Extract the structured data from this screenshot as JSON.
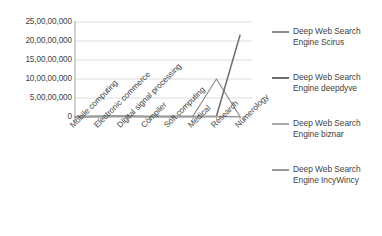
{
  "chart_data": {
    "type": "line",
    "title": "",
    "subtitle": "",
    "xlabel": "",
    "ylabel": "",
    "ylim": [
      0,
      250000000
    ],
    "grid": true,
    "legend_position": "right",
    "ytick_labels": [
      "25,00,00,000",
      "20,00,00,000",
      "15,00,00,000",
      "10,00,00,000",
      "5,00,00,000",
      "0"
    ],
    "ytick_values": [
      250000000,
      200000000,
      150000000,
      100000000,
      50000000,
      0
    ],
    "categories": [
      "Mobile computing",
      "Electronic commerce",
      "Digital signal processing",
      "Compiler",
      "Soft computing",
      "Medical",
      "Research",
      "Numerology"
    ],
    "series": [
      {
        "name": "Deep Web Search Engine Scirus",
        "color": "#8c8c8c",
        "values": [
          1400000,
          2100000,
          2600000,
          1800000,
          1500000,
          1900000,
          100000000,
          1200000
        ]
      },
      {
        "name": "Deep Web Search Engine deepdyve",
        "color": "#6e6e6e",
        "values": [
          900000,
          1500000,
          1800000,
          1200000,
          1000000,
          1300000,
          2000000,
          215000000
        ]
      },
      {
        "name": "Deep Web Search Engine biznar",
        "color": "#a8a8a8",
        "values": [
          700000,
          1100000,
          1400000,
          900000,
          800000,
          1000000,
          1400000,
          900000
        ]
      },
      {
        "name": "Deep Web Search Engine IncyWincy",
        "color": "#9a9a9a",
        "values": [
          500000,
          800000,
          1000000,
          700000,
          600000,
          700000,
          1000000,
          600000
        ]
      }
    ]
  },
  "legend": {
    "items": [
      {
        "label_line1": "Deep Web Search",
        "label_line2": "Engine Scirus"
      },
      {
        "label_line1": "Deep Web Search",
        "label_line2": "Engine deepdyve"
      },
      {
        "label_line1": "Deep Web Search",
        "label_line2": "Engine biznar"
      },
      {
        "label_line1": "Deep Web Search",
        "label_line2": "Engine IncyWincy"
      }
    ]
  },
  "colors": {
    "gridline": "#d4d4d4",
    "axis": "#9a9a9a",
    "text": "#3f3f3f",
    "background": "#ffffff"
  }
}
